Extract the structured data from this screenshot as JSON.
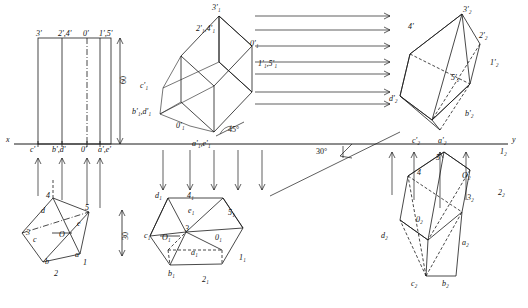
{
  "axes": {
    "x_label": "x",
    "y_label": "y",
    "angle_45": "45°",
    "angle_30": "30°",
    "dim_60": "60",
    "dim_30": "30"
  },
  "labels": [
    {
      "id": "l1",
      "text": "3'",
      "x": 36,
      "y": 30
    },
    {
      "id": "l2",
      "text": "2',4'",
      "x": 66,
      "y": 30
    },
    {
      "id": "l3",
      "text": "0'",
      "x": 88,
      "y": 30
    },
    {
      "id": "l4",
      "text": "1',5'",
      "x": 106,
      "y": 30
    },
    {
      "id": "l5",
      "text": "c'",
      "x": 33,
      "y": 146
    },
    {
      "id": "l6",
      "text": "b',d'",
      "x": 56,
      "y": 146
    },
    {
      "id": "l7",
      "text": "0'",
      "x": 83,
      "y": 146
    },
    {
      "id": "l8",
      "text": "a',e'",
      "x": 104,
      "y": 146
    },
    {
      "id": "l9",
      "text": "x",
      "x": 8,
      "y": 141
    },
    {
      "id": "l10",
      "text": "y",
      "x": 512,
      "y": 141
    },
    {
      "id": "l11",
      "text": "60",
      "x": 125,
      "y": 85
    },
    {
      "id": "l12",
      "text": "30",
      "x": 128,
      "y": 228
    },
    {
      "id": "l13",
      "text": "3'₁",
      "x": 213,
      "y": 8
    },
    {
      "id": "l14",
      "text": "2'₁,4'₁",
      "x": 200,
      "y": 30
    },
    {
      "id": "l15",
      "text": "0'₁",
      "x": 252,
      "y": 44
    },
    {
      "id": "l16",
      "text": "1'₁,5'₁",
      "x": 261,
      "y": 64
    },
    {
      "id": "l17",
      "text": "c'₁",
      "x": 143,
      "y": 86
    },
    {
      "id": "l18",
      "text": "b'₁,d'₁",
      "x": 138,
      "y": 112
    },
    {
      "id": "l19",
      "text": "0'₁",
      "x": 179,
      "y": 126
    },
    {
      "id": "l20",
      "text": "a'₁,e'₁",
      "x": 196,
      "y": 144
    },
    {
      "id": "l21",
      "text": "45°",
      "x": 229,
      "y": 131
    },
    {
      "id": "l22",
      "text": "30°",
      "x": 325,
      "y": 152
    },
    {
      "id": "l23",
      "text": "3'₂",
      "x": 464,
      "y": 10
    },
    {
      "id": "l24",
      "text": "4'",
      "x": 410,
      "y": 27
    },
    {
      "id": "l25",
      "text": "2'₂",
      "x": 480,
      "y": 36
    },
    {
      "id": "l26",
      "text": "1'₂",
      "x": 492,
      "y": 63
    },
    {
      "id": "l27",
      "text": "5'₂",
      "x": 452,
      "y": 78
    },
    {
      "id": "l28",
      "text": "d'₂",
      "x": 392,
      "y": 99
    },
    {
      "id": "l29",
      "text": "b'₂",
      "x": 466,
      "y": 114
    },
    {
      "id": "l30",
      "text": "c'₂",
      "x": 414,
      "y": 141
    },
    {
      "id": "l31",
      "text": "a'₂",
      "x": 440,
      "y": 141
    },
    {
      "id": "l32",
      "text": "1₂",
      "x": 500,
      "y": 152
    },
    {
      "id": "l33",
      "text": "2₂",
      "x": 498,
      "y": 193
    },
    {
      "id": "l34",
      "text": "5",
      "x": 437,
      "y": 158
    },
    {
      "id": "l35",
      "text": "4",
      "x": 418,
      "y": 173
    },
    {
      "id": "l36",
      "text": "O₂",
      "x": 463,
      "y": 176
    },
    {
      "id": "l37",
      "text": "3₂",
      "x": 468,
      "y": 198
    },
    {
      "id": "l38",
      "text": "0₂",
      "x": 417,
      "y": 220
    },
    {
      "id": "l39",
      "text": "d₂",
      "x": 383,
      "y": 236
    },
    {
      "id": "l40",
      "text": "a₂",
      "x": 463,
      "y": 243
    },
    {
      "id": "l41",
      "text": "c₂",
      "x": 412,
      "y": 284
    },
    {
      "id": "l42",
      "text": "b₂",
      "x": 443,
      "y": 284
    },
    {
      "id": "l43",
      "text": "4",
      "x": 47,
      "y": 196
    },
    {
      "id": "l44",
      "text": "5",
      "x": 86,
      "y": 208
    },
    {
      "id": "l45",
      "text": "d",
      "x": 42,
      "y": 211
    },
    {
      "id": "l46",
      "text": "e",
      "x": 78,
      "y": 224
    },
    {
      "id": "l47",
      "text": "3",
      "x": 27,
      "y": 233
    },
    {
      "id": "l48",
      "text": "c",
      "x": 34,
      "y": 240
    },
    {
      "id": "l49",
      "text": "O",
      "x": 60,
      "y": 235
    },
    {
      "id": "l50",
      "text": "a",
      "x": 76,
      "y": 255
    },
    {
      "id": "l51",
      "text": "b",
      "x": 46,
      "y": 262
    },
    {
      "id": "l52",
      "text": "1",
      "x": 84,
      "y": 263
    },
    {
      "id": "l53",
      "text": "2",
      "x": 55,
      "y": 274
    },
    {
      "id": "l54",
      "text": "d₁",
      "x": 157,
      "y": 196
    },
    {
      "id": "l55",
      "text": "4₁",
      "x": 188,
      "y": 196
    },
    {
      "id": "l56",
      "text": "e₁",
      "x": 189,
      "y": 211
    },
    {
      "id": "l57",
      "text": "5₁",
      "x": 229,
      "y": 213
    },
    {
      "id": "l58",
      "text": "c₁",
      "x": 145,
      "y": 236
    },
    {
      "id": "l59",
      "text": "3",
      "x": 186,
      "y": 229
    },
    {
      "id": "l60",
      "text": "O₁",
      "x": 163,
      "y": 238
    },
    {
      "id": "l61",
      "text": "0₁",
      "x": 216,
      "y": 238
    },
    {
      "id": "l62",
      "text": "a₁",
      "x": 192,
      "y": 253
    },
    {
      "id": "l63",
      "text": "1₁",
      "x": 240,
      "y": 258
    },
    {
      "id": "l64",
      "text": "b₁",
      "x": 169,
      "y": 274
    },
    {
      "id": "l65",
      "text": "2₁",
      "x": 203,
      "y": 280
    }
  ],
  "colors": {
    "stroke": "#1a1a1a",
    "background": "#ffffff"
  }
}
